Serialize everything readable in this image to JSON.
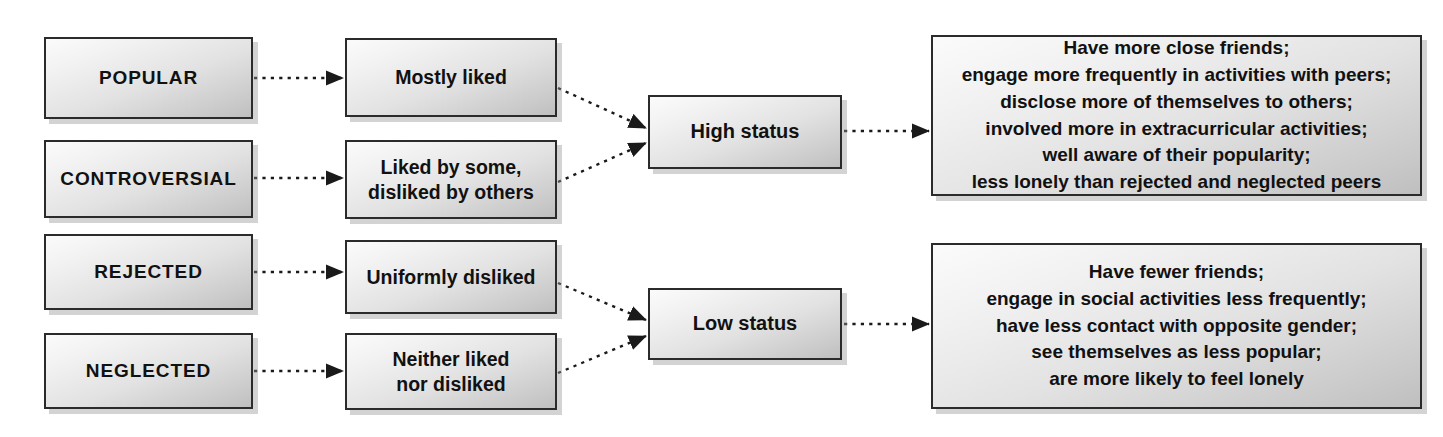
{
  "diagram": {
    "colors": {
      "box_border": "#2b2b2b",
      "box_fill_light": "#fbfbfb",
      "box_fill_dark": "#bfbfbf",
      "shadow": "#969696",
      "connector": "#1a1a1a",
      "text": "#111111",
      "background": "#ffffff"
    },
    "columns": {
      "category_label": "Sociometric category",
      "descriptor_label": "Peer nomination pattern",
      "status_label": "Status level",
      "outcome_label": "Social correlates"
    },
    "categories": [
      {
        "id": "popular",
        "label": "POPULAR"
      },
      {
        "id": "controversial",
        "label": "CONTROVERSIAL"
      },
      {
        "id": "rejected",
        "label": "REJECTED"
      },
      {
        "id": "neglected",
        "label": "NEGLECTED"
      }
    ],
    "descriptors": [
      {
        "id": "mostly-liked",
        "label": "Mostly liked"
      },
      {
        "id": "liked-by-some",
        "label": "Liked by some,\ndisliked by others"
      },
      {
        "id": "uniformly-disliked",
        "label": "Uniformly disliked"
      },
      {
        "id": "neither-liked",
        "label": "Neither liked\nnor disliked"
      }
    ],
    "statuses": [
      {
        "id": "high-status",
        "label": "High status"
      },
      {
        "id": "low-status",
        "label": "Low status"
      }
    ],
    "outcomes": [
      {
        "id": "high-status-outcomes",
        "label": "Have more close friends;\nengage more frequently in activities with peers;\ndisclose more of themselves to others;\ninvolved more in extracurricular activities;\nwell aware of their popularity;\nless lonely than rejected and neglected peers"
      },
      {
        "id": "low-status-outcomes",
        "label": "Have fewer friends;\nengage in social activities less frequently;\nhave less contact with opposite gender;\nsee themselves as less popular;\nare more likely to feel lonely"
      }
    ],
    "connections": [
      {
        "from": "popular",
        "to": "mostly-liked",
        "style": "dotted-arrow"
      },
      {
        "from": "controversial",
        "to": "liked-by-some",
        "style": "dotted-arrow"
      },
      {
        "from": "rejected",
        "to": "uniformly-disliked",
        "style": "dotted-arrow"
      },
      {
        "from": "neglected",
        "to": "neither-liked",
        "style": "dotted-arrow"
      },
      {
        "from": "mostly-liked",
        "to": "high-status",
        "style": "dotted-arrow"
      },
      {
        "from": "liked-by-some",
        "to": "high-status",
        "style": "dotted-arrow"
      },
      {
        "from": "uniformly-disliked",
        "to": "low-status",
        "style": "dotted-arrow"
      },
      {
        "from": "neither-liked",
        "to": "low-status",
        "style": "dotted-arrow"
      },
      {
        "from": "high-status",
        "to": "high-status-outcomes",
        "style": "dotted-arrow"
      },
      {
        "from": "low-status",
        "to": "low-status-outcomes",
        "style": "dotted-arrow"
      }
    ]
  }
}
